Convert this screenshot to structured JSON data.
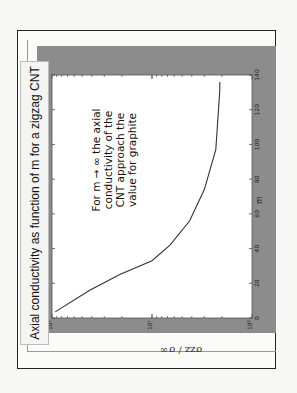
{
  "chart_data": {
    "type": "line",
    "title": "Axial conductivity as function of m for a zigzag CNT",
    "xlabel": "m",
    "ylabel": "σzz / σ∞",
    "yscale": "log",
    "xlim": [
      0,
      140
    ],
    "ylim": [
      1,
      100
    ],
    "x_ticks": [
      "0",
      "20",
      "40",
      "60",
      "80",
      "100",
      "120",
      "140"
    ],
    "y_ticks": [
      "10^0",
      "10^1",
      "10^2"
    ],
    "grid": false,
    "orientation": "rotated 90° counter-clockwise",
    "series": [
      {
        "name": "σzz/σ∞",
        "x": [
          3.5,
          16,
          25,
          33,
          42,
          56,
          74,
          97,
          131,
          136
        ],
        "y": [
          93,
          42,
          21,
          10,
          6.6,
          4.2,
          3.0,
          2.3,
          2.1,
          2.1
        ]
      }
    ],
    "annotations": [
      "For m → ∞ the axial conductivity of the CNT approach the value for graphite"
    ]
  },
  "title": "Axial conductivity as function of m for a zigzag CNT",
  "annotation_lines": [
    "For m → ∞ the axial",
    "conductivity of the",
    "CNT approach the",
    "value for graphite"
  ],
  "axis": {
    "x_label": "m",
    "y_label": "σzz / σ∞",
    "x_ticks": [
      "0",
      "20",
      "40",
      "60",
      "80",
      "100",
      "120",
      "140"
    ],
    "y_tick_mantissa": "10",
    "y_tick_exps": [
      "2",
      "1",
      "0"
    ]
  },
  "colors": {
    "figure_bg": "#8c8c8c",
    "plot_bg": "#ffffff",
    "line": "#333333"
  }
}
